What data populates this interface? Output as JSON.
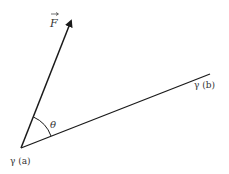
{
  "diagram": {
    "type": "vector-angle-diagram",
    "colors": {
      "stroke": "#1a1a1a",
      "label": "#333333",
      "background": "#ffffff"
    },
    "points": {
      "start": {
        "x": 21,
        "y": 148,
        "label": "γ (a)"
      },
      "end": {
        "x": 210,
        "y": 74,
        "label": "γ (b)"
      },
      "force_tip": {
        "x": 72,
        "y": 18
      }
    },
    "labels": {
      "force": "F",
      "angle": "θ",
      "start": "γ (a)",
      "end": "γ (b)"
    }
  }
}
